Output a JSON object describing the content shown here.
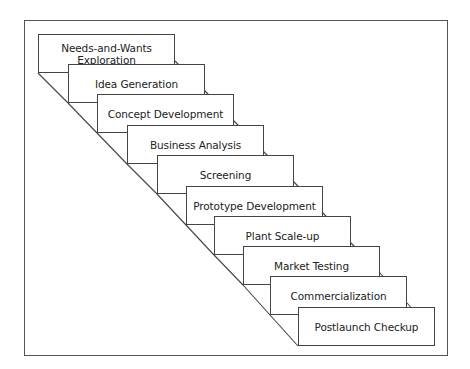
{
  "diagram": {
    "type": "staircase process flow",
    "steps": [
      {
        "label": "Needs-and-Wants Exploration",
        "x": 38,
        "y": 34
      },
      {
        "label": "Idea Generation",
        "x": 68,
        "y": 64
      },
      {
        "label": "Concept Development",
        "x": 97,
        "y": 94
      },
      {
        "label": "Business Analysis",
        "x": 127,
        "y": 125
      },
      {
        "label": "Screening",
        "x": 157,
        "y": 155
      },
      {
        "label": "Prototype Development",
        "x": 186,
        "y": 186
      },
      {
        "label": "Plant Scale-up",
        "x": 214,
        "y": 216
      },
      {
        "label": "Market Testing",
        "x": 243,
        "y": 246
      },
      {
        "label": "Commercialization",
        "x": 270,
        "y": 276
      },
      {
        "label": "Postlaunch Checkup",
        "x": 298,
        "y": 307
      }
    ],
    "colors": {
      "border": "#444444",
      "background": "#ffffff",
      "text": "#222222"
    }
  }
}
